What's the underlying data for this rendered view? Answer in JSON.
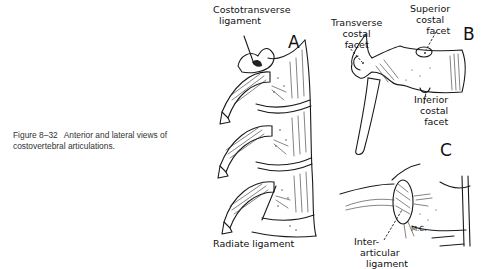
{
  "figure": {
    "number": "Figure 8–32",
    "caption": "Anterior and lateral views of costovertebral articulations."
  },
  "panels": [
    {
      "letter": "A",
      "labels": [
        "Costotransverse ligament",
        "Radiate ligament"
      ]
    },
    {
      "letter": "B",
      "labels": [
        "Transverse costal facet",
        "Superior costal facet",
        "Inferior costal facet"
      ]
    },
    {
      "letter": "C",
      "labels": [
        "Inter-articular ligament"
      ],
      "signature": "M.C."
    }
  ],
  "labels": {
    "costotransverse_1": "Costotransverse",
    "costotransverse_2": "ligament",
    "radiate": "Radiate ligament",
    "transverse_1": "Transverse",
    "transverse_2": "costal",
    "transverse_3": "facet",
    "superior_1": "Superior",
    "superior_2": "costal",
    "superior_3": "facet",
    "inferior_1": "Inferior",
    "inferior_2": "costal",
    "inferior_3": "facet",
    "interarticular_1": "Inter-",
    "interarticular_2": "articular",
    "interarticular_3": "ligament",
    "signature": "M.C."
  },
  "letters": {
    "a": "A",
    "b": "B",
    "c": "C"
  }
}
